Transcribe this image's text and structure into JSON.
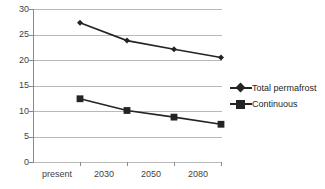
{
  "chart_data": {
    "type": "line",
    "title": "",
    "xlabel": "",
    "ylabel": "",
    "categories": [
      "present",
      "2030",
      "2050",
      "2080"
    ],
    "ylim": [
      0,
      30
    ],
    "yticks": [
      0,
      5,
      10,
      15,
      20,
      25,
      30
    ],
    "ytick_labels": [
      "0",
      "5",
      "10",
      "15",
      "20",
      "25",
      "30"
    ],
    "grid": true,
    "legend_position": "right",
    "series": [
      {
        "name": "Total permafrost",
        "marker": "diamond",
        "color": "#242424",
        "values": [
          27.3,
          23.8,
          22.1,
          20.5
        ]
      },
      {
        "name": "Continuous",
        "marker": "square",
        "color": "#242424",
        "values": [
          12.4,
          10.1,
          8.8,
          7.4
        ]
      }
    ]
  },
  "legend": {
    "items": [
      {
        "label": "Total permafrost",
        "marker": "diamond"
      },
      {
        "label": "Continuous",
        "marker": "square"
      }
    ]
  },
  "colors": {
    "series": "#242424",
    "gridline": "#b9b9b9",
    "axis": "#8a8a8a",
    "text": "#3f3f3f",
    "background": "#ffffff"
  }
}
